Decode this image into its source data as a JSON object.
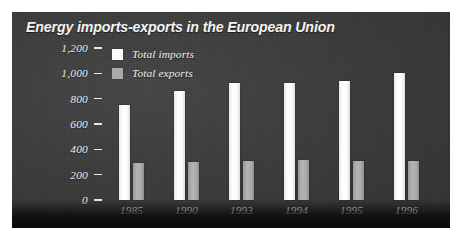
{
  "chart_data": {
    "type": "bar",
    "title": "Energy imports-exports in the European Union",
    "xlabel": "",
    "ylabel": "",
    "categories": [
      "1985",
      "1990",
      "1993",
      "1994",
      "1995",
      "1996"
    ],
    "series": [
      {
        "name": "Total imports",
        "color": "#fbfbfb",
        "values": [
          750,
          860,
          925,
          925,
          940,
          1000
        ]
      },
      {
        "name": "Total exports",
        "color": "#a9a9a9",
        "values": [
          290,
          300,
          310,
          315,
          310,
          305
        ]
      }
    ],
    "ylim": [
      0,
      1200
    ],
    "yticks": [
      {
        "value": 1200,
        "label": "1,200"
      },
      {
        "value": 1000,
        "label": "1,000"
      },
      {
        "value": 800,
        "label": "800"
      },
      {
        "value": 600,
        "label": "600"
      },
      {
        "value": 400,
        "label": "400"
      },
      {
        "value": 200,
        "label": "200"
      },
      {
        "value": 0,
        "label": "0"
      }
    ],
    "grid": false,
    "legend_position": "top-left",
    "legend": [
      "Total imports",
      "Total exports"
    ]
  },
  "panel": {
    "background_color": "#3b3b3b",
    "title_color": "#f4f4f4",
    "text_color": "#f0f0f0"
  }
}
